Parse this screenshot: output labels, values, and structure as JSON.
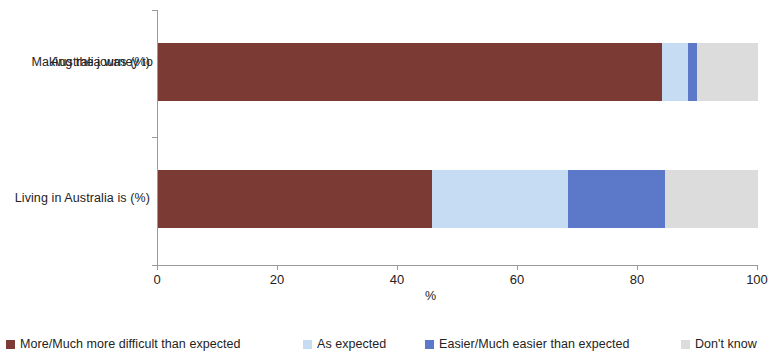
{
  "chart_data": {
    "type": "bar",
    "orientation": "horizontal",
    "stacked": true,
    "stack_mode": "percent",
    "title": "",
    "subtitle": "",
    "xlabel": "%",
    "ylabel": "",
    "xlim": [
      0,
      100
    ],
    "xticks": [
      0,
      20,
      40,
      60,
      80,
      100
    ],
    "xtick_labels": [
      "0",
      "20",
      "40",
      "60",
      "80",
      "100"
    ],
    "grid": false,
    "legend_position": "bottom",
    "categories": [
      "Making the journey to Australia was (%)",
      "Living in Australia is (%)"
    ],
    "series": [
      {
        "name": "More/Much more difficult than expected",
        "color": "#7B3A33",
        "values": [
          84.0,
          45.7
        ]
      },
      {
        "name": "As expected",
        "color": "#C5DCF2",
        "values": [
          4.3,
          22.6
        ]
      },
      {
        "name": "Easier/Much easier than expected",
        "color": "#5B79C8",
        "values": [
          1.5,
          16.2
        ]
      },
      {
        "name": "Don't know",
        "color": "#DCDCDC",
        "values": [
          10.2,
          15.5
        ]
      }
    ]
  },
  "category_labels": [
    {
      "line1": "Making the journey  to",
      "line2": "Australia was (%)"
    },
    {
      "line1": "Living  in Australia  is (%)",
      "line2": ""
    }
  ],
  "axis": {
    "x_title": "%",
    "tick_0": "0",
    "tick_20": "20",
    "tick_40": "40",
    "tick_60": "60",
    "tick_80": "80",
    "tick_100": "100"
  },
  "legend": {
    "items": [
      {
        "label": "More/Much more difficult than expected",
        "color": "#7B3A33"
      },
      {
        "label": "As expected",
        "color": "#C5DCF2"
      },
      {
        "label": "Easier/Much easier than expected",
        "color": "#5B79C8"
      },
      {
        "label": "Don't know",
        "color": "#DCDCDC"
      }
    ]
  }
}
